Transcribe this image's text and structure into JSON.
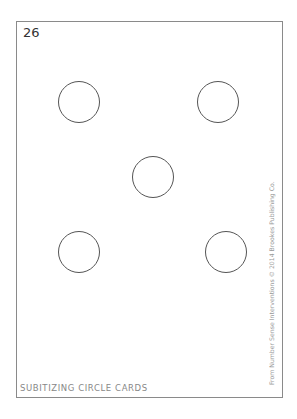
{
  "card": {
    "number": "26",
    "footer_label": "SUBITIZING CIRCLE CARDS",
    "credit": "From Number Sense Interventions © 2014 Brookes Publishing Co.",
    "circle_count": 5,
    "circles": [
      {
        "position": "top-left"
      },
      {
        "position": "top-right"
      },
      {
        "position": "center"
      },
      {
        "position": "bottom-left"
      },
      {
        "position": "bottom-right"
      }
    ]
  }
}
